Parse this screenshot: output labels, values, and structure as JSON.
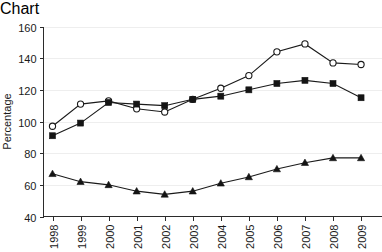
{
  "chart_data": {
    "type": "line",
    "title": "",
    "xlabel": "",
    "ylabel": "Percentage",
    "categories": [
      "1998",
      "1999",
      "2000",
      "2001",
      "2002",
      "2003",
      "2004",
      "2005",
      "2006",
      "2007",
      "2008",
      "2009"
    ],
    "ylim": [
      40,
      160
    ],
    "yticks": [
      40,
      60,
      80,
      100,
      120,
      140,
      160
    ],
    "ytick_labels": [
      "40",
      "60",
      "80",
      "100",
      "120",
      "140",
      "160"
    ],
    "grid": true,
    "grid_axis": "y",
    "legend": "none",
    "series": [
      {
        "name": "open-circle-series",
        "marker": "circle-open",
        "color": "#1a1a1a",
        "values": [
          97,
          111,
          113,
          108,
          106,
          114,
          121,
          129,
          144,
          149,
          137,
          136
        ]
      },
      {
        "name": "filled-square-series",
        "marker": "square-filled",
        "color": "#141414",
        "values": [
          91,
          99,
          112,
          111,
          110,
          114,
          116,
          120,
          124,
          126,
          124,
          115
        ]
      },
      {
        "name": "filled-triangle-series",
        "marker": "triangle-filled",
        "color": "#141414",
        "values": [
          67,
          62,
          60,
          56,
          54,
          56,
          61,
          65,
          70,
          74,
          77,
          77
        ]
      }
    ]
  },
  "axis": {
    "y_axis_label": "Percentage"
  },
  "colors": {
    "ink": "#1a1a1a",
    "grid": "#eeeeee",
    "background": "#ffffff"
  }
}
